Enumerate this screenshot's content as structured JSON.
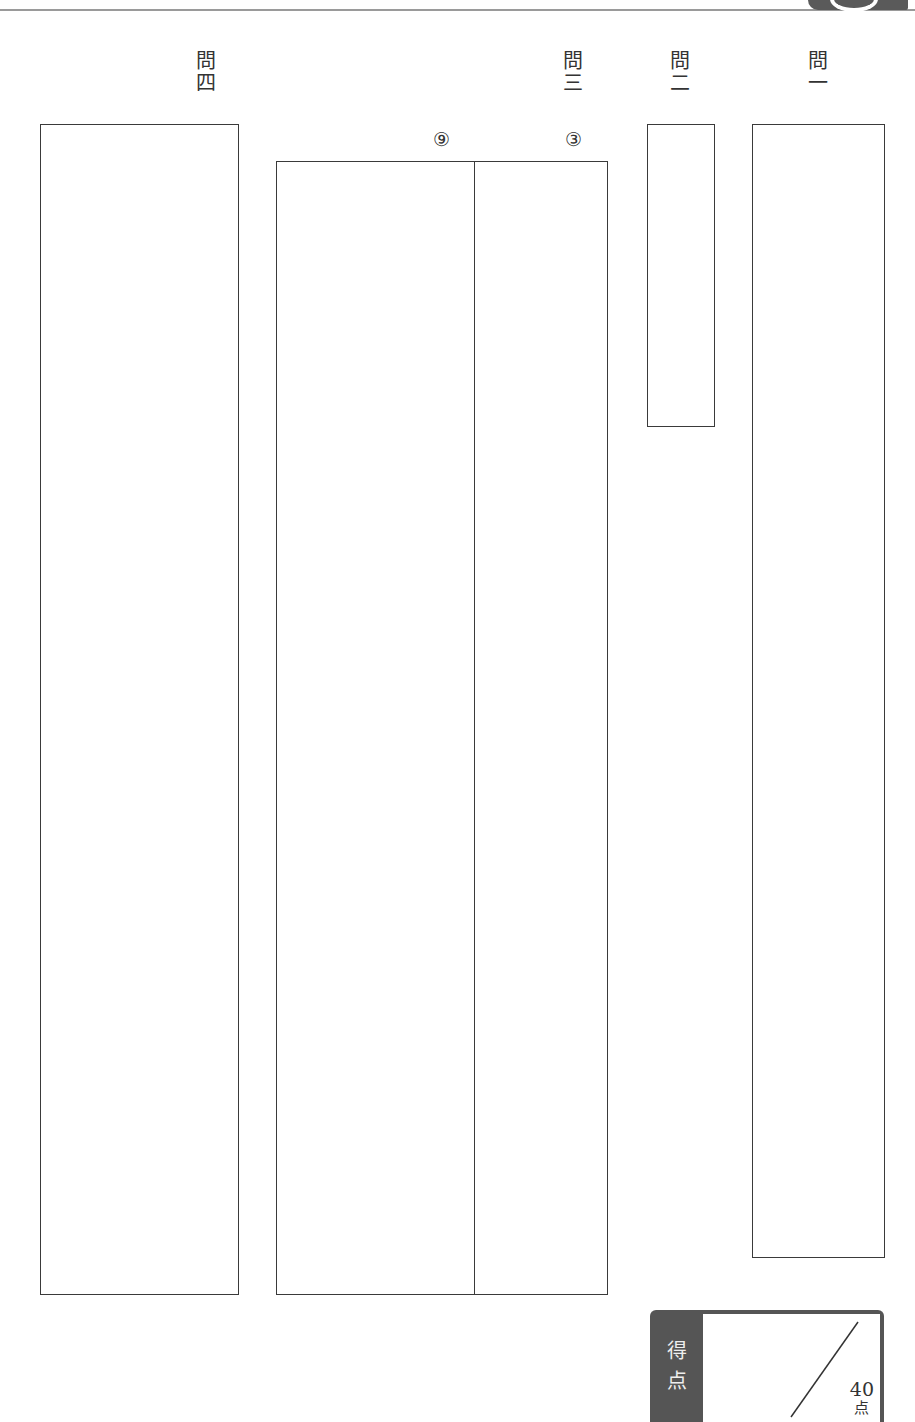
{
  "header": {
    "tab_color": "#5a5a5a",
    "rule_color": "#9a9a9a"
  },
  "questions": [
    {
      "id": "q1",
      "label_top": "問",
      "label_bottom": "一"
    },
    {
      "id": "q2",
      "label_top": "問",
      "label_bottom": "二"
    },
    {
      "id": "q3",
      "label_top": "問",
      "label_bottom": "三",
      "sub_items": [
        "③",
        "⑨"
      ]
    },
    {
      "id": "q4",
      "label_top": "問",
      "label_bottom": "四"
    }
  ],
  "score": {
    "label_line1": "得",
    "label_line2": "点",
    "max_points": "40",
    "unit": "点",
    "panel_color": "#555555"
  }
}
